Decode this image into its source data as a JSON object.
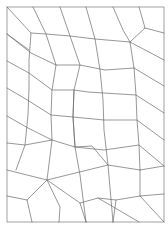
{
  "diagram": {
    "type": "quadrilateral-mesh",
    "stroke_color": "#6a6a6a",
    "frame_color": "#8a8a8a",
    "background": "#ffffff",
    "frame": {
      "x": 7,
      "y": 7,
      "w": 157,
      "h": 215
    },
    "polylines": [
      [
        [
          7,
          7
        ],
        [
          31,
          33
        ],
        [
          29,
          60
        ],
        [
          29,
          88
        ],
        [
          28,
          115
        ],
        [
          25,
          145
        ],
        [
          16,
          170
        ]
      ],
      [
        [
          33,
          7
        ],
        [
          46,
          34
        ],
        [
          56,
          65
        ],
        [
          52,
          90
        ],
        [
          51,
          115
        ],
        [
          52,
          140
        ],
        [
          47,
          180
        ],
        [
          27,
          200
        ],
        [
          32,
          222
        ]
      ],
      [
        [
          60,
          7
        ],
        [
          70,
          36
        ],
        [
          80,
          65
        ],
        [
          74,
          90
        ],
        [
          73,
          117
        ],
        [
          75,
          147
        ],
        [
          80,
          175
        ],
        [
          86,
          222
        ]
      ],
      [
        [
          86,
          7
        ],
        [
          95,
          39
        ],
        [
          100,
          70
        ],
        [
          103,
          100
        ],
        [
          104,
          130
        ],
        [
          108,
          165
        ],
        [
          113,
          222
        ]
      ],
      [
        [
          113,
          7
        ],
        [
          123,
          30
        ],
        [
          130,
          42
        ],
        [
          134,
          68
        ],
        [
          136,
          95
        ],
        [
          137,
          120
        ],
        [
          139,
          145
        ],
        [
          140,
          170
        ],
        [
          140,
          196
        ],
        [
          164,
          222
        ]
      ],
      [
        [
          139,
          7
        ],
        [
          145,
          28
        ],
        [
          130,
          42
        ]
      ],
      [
        [
          145,
          28
        ],
        [
          164,
          33
        ]
      ],
      [
        [
          7,
          34
        ],
        [
          31,
          53
        ],
        [
          56,
          65
        ]
      ],
      [
        [
          31,
          33
        ],
        [
          46,
          34
        ],
        [
          70,
          36
        ],
        [
          95,
          39
        ],
        [
          130,
          42
        ]
      ],
      [
        [
          7,
          34
        ],
        [
          29,
          50
        ]
      ],
      [
        [
          56,
          65
        ],
        [
          80,
          65
        ],
        [
          105,
          70
        ],
        [
          134,
          68
        ]
      ],
      [
        [
          7,
          61
        ],
        [
          29,
          73
        ],
        [
          52,
          90
        ],
        [
          74,
          90
        ],
        [
          88,
          92
        ],
        [
          136,
          95
        ],
        [
          164,
          113
        ]
      ],
      [
        [
          7,
          88
        ],
        [
          29,
          101
        ],
        [
          51,
          115
        ],
        [
          73,
          117
        ],
        [
          104,
          120
        ],
        [
          137,
          120
        ],
        [
          164,
          140
        ]
      ],
      [
        [
          7,
          116
        ],
        [
          28,
          128
        ],
        [
          52,
          140
        ],
        [
          75,
          147
        ],
        [
          104,
          150
        ],
        [
          139,
          145
        ],
        [
          164,
          166
        ]
      ],
      [
        [
          7,
          143
        ],
        [
          25,
          145
        ],
        [
          52,
          140
        ]
      ],
      [
        [
          74,
          90
        ],
        [
          73,
          117
        ],
        [
          75,
          147
        ],
        [
          92,
          146
        ],
        [
          108,
          165
        ]
      ],
      [
        [
          130,
          42
        ],
        [
          164,
          60
        ]
      ],
      [
        [
          134,
          68
        ],
        [
          164,
          86
        ]
      ],
      [
        [
          7,
          170
        ],
        [
          47,
          180
        ],
        [
          108,
          165
        ],
        [
          140,
          170
        ]
      ],
      [
        [
          7,
          196
        ],
        [
          27,
          200
        ]
      ],
      [
        [
          47,
          180
        ],
        [
          60,
          207
        ],
        [
          59,
          222
        ]
      ],
      [
        [
          47,
          180
        ],
        [
          80,
          203
        ],
        [
          98,
          198
        ],
        [
          116,
          200
        ],
        [
          140,
          196
        ]
      ],
      [
        [
          98,
          198
        ],
        [
          139,
          222
        ]
      ],
      [
        [
          140,
          196
        ],
        [
          164,
          194
        ]
      ],
      [
        [
          140,
          170
        ],
        [
          164,
          166
        ]
      ],
      [
        [
          80,
          203
        ],
        [
          86,
          222
        ]
      ],
      [
        [
          116,
          200
        ],
        [
          113,
          222
        ]
      ]
    ]
  }
}
